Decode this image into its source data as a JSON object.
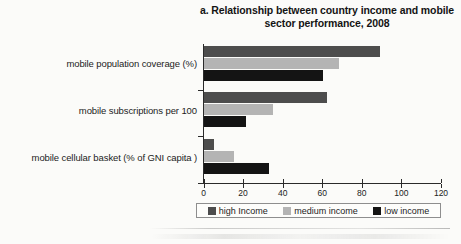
{
  "chart_data": {
    "type": "bar",
    "orientation": "horizontal",
    "title": "a. Relationship between country income and mobile sector performance, 2008",
    "title_line1": "a. Relationship between country income and mobile",
    "title_line2": "sector performance, 2008",
    "xlabel": "",
    "ylabel": "",
    "categories": [
      "mobile population coverage (%)",
      "mobile subscriptions per 100",
      "mobile cellular basket (% of GNI capita )"
    ],
    "series": [
      {
        "name": "high Income",
        "color": "#4d4d4d",
        "values": [
          89,
          62,
          5
        ]
      },
      {
        "name": "medium income",
        "color": "#b4b4b4",
        "values": [
          68,
          35,
          15
        ]
      },
      {
        "name": "low income",
        "color": "#141414",
        "values": [
          60,
          21,
          33
        ]
      }
    ],
    "xlim": [
      0,
      120
    ],
    "xticks": [
      0,
      20,
      40,
      60,
      80,
      100,
      120
    ],
    "xtick_labels": [
      "0",
      "20",
      "40",
      "60",
      "80",
      "100",
      "120"
    ],
    "grid": false,
    "legend_position": "bottom"
  },
  "legend": {
    "items": [
      {
        "label": "high Income",
        "swatch": "high"
      },
      {
        "label": "medium income",
        "swatch": "medium"
      },
      {
        "label": "low income",
        "swatch": "low"
      }
    ]
  },
  "colors": {
    "high_income": "#4d4d4d",
    "medium_income": "#b4b4b4",
    "low_income": "#141414",
    "axis": "#2a2a2a",
    "background": "#fbfbf9"
  }
}
